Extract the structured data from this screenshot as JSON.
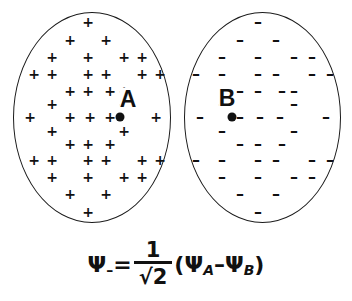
{
  "figure": {
    "background_color": "#ffffff",
    "stroke_color": "#1a1a1a"
  },
  "lobes": [
    {
      "id": "lobe-a",
      "label": "A",
      "sign_glyph": "+",
      "sign_name": "plus-sign",
      "phase": "positive",
      "center": {
        "x": 120,
        "y": 117
      },
      "nucleus_name": "nucleus-a"
    },
    {
      "id": "lobe-b",
      "label": "B",
      "sign_glyph": "–",
      "sign_name": "minus-sign",
      "phase": "negative",
      "center": {
        "x": 232,
        "y": 117
      },
      "nucleus_name": "nucleus-b"
    }
  ],
  "formula": {
    "psi": "Ψ",
    "psi_subscript": "–",
    "equals": "=",
    "numerator": "1",
    "radical": "√",
    "denominator_value": "2",
    "open_paren": "(",
    "psi_a_sub": "A",
    "operator": "–",
    "psi_b_sub": "B",
    "close_paren": ")",
    "plain_text": "Ψ– = 1/√2 (ΨA – ΨB)"
  },
  "sign_rows_plus": [
    {
      "y": 22,
      "xs": [
        88
      ]
    },
    {
      "y": 40,
      "xs": [
        70,
        106
      ]
    },
    {
      "y": 57,
      "xs": [
        52,
        88,
        124,
        142
      ]
    },
    {
      "y": 74,
      "xs": [
        34,
        52,
        88,
        106,
        142,
        160
      ]
    },
    {
      "y": 91,
      "xs": [
        70,
        88,
        110,
        124
      ]
    },
    {
      "y": 104,
      "xs": [
        52,
        124
      ]
    },
    {
      "y": 117,
      "xs": [
        30,
        70,
        90,
        110,
        156
      ]
    },
    {
      "y": 131,
      "xs": [
        52,
        124
      ]
    },
    {
      "y": 144,
      "xs": [
        70,
        88,
        110
      ]
    },
    {
      "y": 160,
      "xs": [
        34,
        52,
        88,
        106,
        142,
        160
      ]
    },
    {
      "y": 177,
      "xs": [
        52,
        88,
        124,
        142
      ]
    },
    {
      "y": 194,
      "xs": [
        70,
        106
      ]
    },
    {
      "y": 212,
      "xs": [
        88
      ]
    }
  ],
  "sign_rows_minus": [
    {
      "y": 22,
      "xs": [
        258
      ]
    },
    {
      "y": 40,
      "xs": [
        240,
        276
      ]
    },
    {
      "y": 57,
      "xs": [
        222,
        258,
        294,
        312
      ]
    },
    {
      "y": 74,
      "xs": [
        196,
        222,
        258,
        276,
        312,
        330
      ]
    },
    {
      "y": 91,
      "xs": [
        240,
        258,
        282,
        294
      ]
    },
    {
      "y": 104,
      "xs": [
        222,
        294
      ]
    },
    {
      "y": 117,
      "xs": [
        200,
        240,
        260,
        280,
        326
      ]
    },
    {
      "y": 131,
      "xs": [
        222,
        294
      ]
    },
    {
      "y": 144,
      "xs": [
        240,
        258,
        282
      ]
    },
    {
      "y": 160,
      "xs": [
        196,
        222,
        258,
        276,
        312,
        330
      ]
    },
    {
      "y": 177,
      "xs": [
        222,
        258,
        294,
        312
      ]
    },
    {
      "y": 194,
      "xs": [
        240,
        276
      ]
    },
    {
      "y": 212,
      "xs": [
        258
      ]
    }
  ],
  "labels": {
    "a_label": {
      "text": "A",
      "x": 128,
      "y": 99
    },
    "b_label": {
      "text": "B",
      "x": 227,
      "y": 98
    }
  }
}
